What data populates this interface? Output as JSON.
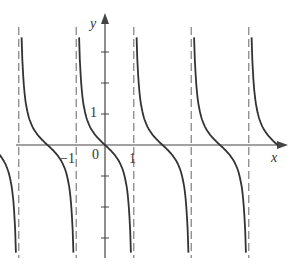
{
  "chart_data": {
    "type": "line",
    "title": "",
    "function": "y = -tan(pi*x/2 ... ) style cotangent-like curve (decreasing branches with vertical asymptotes)",
    "xlabel": "x",
    "ylabel": "y",
    "x_tick_labels": [
      "-1",
      "0",
      "1"
    ],
    "y_tick_labels": [
      "1"
    ],
    "asymptotes_x": [
      -1.5,
      -0.5,
      0.5,
      1.5,
      2.5
    ],
    "zeros_x": [
      -1,
      0,
      1,
      2,
      3
    ],
    "branches": [
      {
        "x_range": [
          -2.0,
          -1.5
        ],
        "y_range": [
          -0.9,
          -4.0
        ]
      },
      {
        "x_range": [
          -1.5,
          -0.5
        ],
        "y_range": [
          4.0,
          -4.0
        ],
        "zero": -1
      },
      {
        "x_range": [
          -0.5,
          0.5
        ],
        "y_range": [
          4.0,
          -4.0
        ],
        "zero": 0
      },
      {
        "x_range": [
          0.5,
          1.5
        ],
        "y_range": [
          4.0,
          -4.0
        ],
        "zero": 1
      },
      {
        "x_range": [
          1.5,
          2.5
        ],
        "y_range": [
          4.0,
          -4.0
        ],
        "zero": 2
      },
      {
        "x_range": [
          2.5,
          3.0
        ],
        "y_range": [
          4.0,
          -1.0
        ],
        "zero": 3
      }
    ],
    "grid": false,
    "legend": null
  },
  "labels": {
    "x_axis": "x",
    "y_axis": "y",
    "origin": "0",
    "tick_neg1": "−1",
    "tick_1_x": "1",
    "tick_1_y": "1"
  },
  "colors": {
    "curve": "#333333",
    "axis": "#444444",
    "asymptote": "#888888"
  }
}
